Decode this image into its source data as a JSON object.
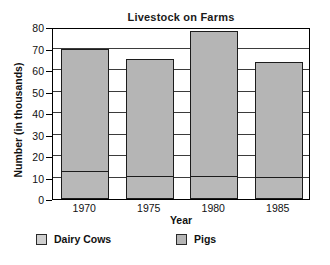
{
  "chart_data": {
    "type": "bar",
    "subtype": "stacked-vertical-bar",
    "title": "Livestock on Farms",
    "xlabel": "Year",
    "ylabel": "Number (in thousands)",
    "categories": [
      "1970",
      "1975",
      "1980",
      "1985"
    ],
    "series": [
      {
        "name": "Dairy Cows",
        "values": [
          13,
          10.5,
          10.8,
          10.3
        ],
        "color": "#cfcfcf"
      },
      {
        "name": "Pigs",
        "values": [
          57,
          54.5,
          67.2,
          53.2
        ],
        "color": "#b5b5b5"
      }
    ],
    "totals": [
      70,
      65,
      78,
      63.5
    ],
    "ylim": [
      0,
      80
    ],
    "yticks": [
      0,
      10,
      20,
      30,
      40,
      50,
      60,
      70,
      80
    ],
    "ytick_labels": [
      "0",
      "10",
      "20",
      "30",
      "40",
      "50",
      "60",
      "70",
      "80"
    ],
    "grid": true,
    "grid_axis": "y",
    "legend_position": "bottom",
    "legend": [
      "Dairy Cows",
      "Pigs"
    ]
  },
  "style": {
    "bar_fill": "#b5b5b5",
    "cows_fill": "#b8b8b8",
    "legend_cows_fill": "#cfcfcf",
    "bar_border": "#1c1c1c",
    "axis_color": "#000000",
    "grid_color": "#3b3b3b",
    "text_color": "#111111",
    "background": "#ffffff"
  }
}
